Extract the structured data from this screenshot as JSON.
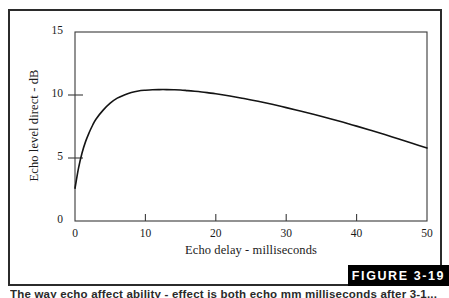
{
  "figure": {
    "badge_label": "FIGURE 3-19",
    "caption": "The way echo affect ability - effect is both echo mm milliseconds after 3-1..."
  },
  "colors": {
    "frame": "#2b2b2b",
    "axis": "#3a3a3a",
    "curve": "#141414",
    "badge_background": "#000000",
    "badge_text": "#ffffff",
    "background": "#ffffff"
  },
  "chart_data": {
    "type": "line",
    "title": "",
    "xlabel": "Echo delay - milliseconds",
    "ylabel": "Echo level direct - dB",
    "xlim": [
      0,
      50
    ],
    "ylim": [
      0,
      15
    ],
    "xticks": [
      0,
      10,
      20,
      30,
      40,
      50
    ],
    "yticks": [
      0,
      5,
      10,
      15
    ],
    "xtick_labels": [
      "0",
      "10",
      "20",
      "30",
      "40",
      "50"
    ],
    "ytick_labels": [
      "0",
      "5",
      "10",
      "15"
    ],
    "grid": false,
    "legend": false,
    "series": [
      {
        "name": "Echo level direct",
        "x": [
          0,
          0.5,
          1,
          1.5,
          2,
          2.5,
          3,
          4,
          5,
          6,
          7,
          8,
          9,
          10,
          11,
          12,
          13,
          14,
          15,
          16,
          17,
          18,
          19,
          20,
          22,
          24,
          26,
          28,
          30,
          32,
          34,
          36,
          38,
          40,
          42,
          44,
          46,
          48,
          50
        ],
        "y": [
          2.6,
          4.2,
          5.4,
          6.3,
          7.0,
          7.6,
          8.1,
          8.8,
          9.35,
          9.75,
          10.0,
          10.2,
          10.32,
          10.38,
          10.42,
          10.43,
          10.43,
          10.42,
          10.4,
          10.35,
          10.3,
          10.24,
          10.17,
          10.1,
          9.92,
          9.72,
          9.5,
          9.26,
          9.0,
          8.73,
          8.45,
          8.15,
          7.85,
          7.53,
          7.2,
          6.86,
          6.5,
          6.15,
          5.8
        ]
      }
    ]
  }
}
